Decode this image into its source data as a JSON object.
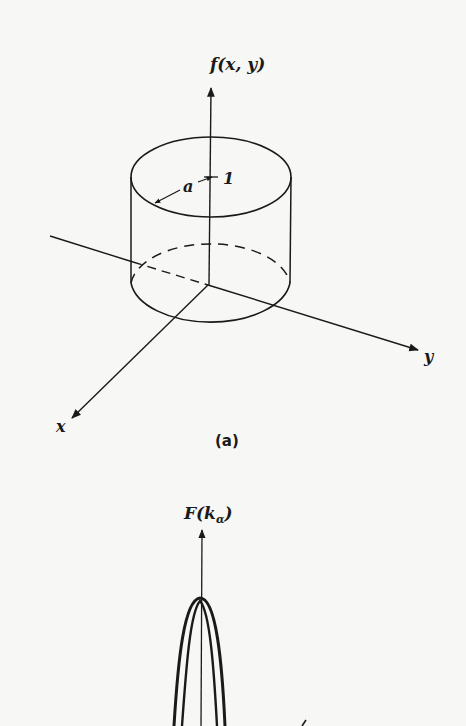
{
  "figure_a": {
    "function_label": "f(x, y)",
    "x_axis_label": "x",
    "y_axis_label": "y",
    "radius_label": "a",
    "height_label": "1",
    "caption": "(a)"
  },
  "figure_b": {
    "function_label_main": "F(k",
    "function_label_sub": "α",
    "function_label_close": ")"
  },
  "colors": {
    "ink": "#1a1a1a",
    "paper": "#f7f7f5"
  }
}
